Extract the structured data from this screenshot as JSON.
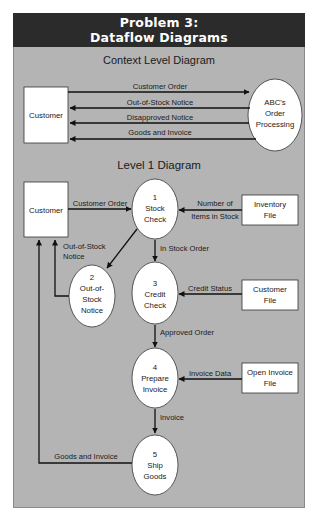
{
  "header": {
    "line1": "Problem 3:",
    "line2": "Dataflow Diagrams"
  },
  "colors": {
    "header_bg": "#2b2b2b",
    "panel_bg": "#b4b4b4",
    "node_fill": "#ffffff",
    "line": "#111111"
  },
  "context": {
    "title": "Context Level Diagram",
    "entity": "Customer",
    "process": {
      "line1": "ABC's",
      "line2": "Order",
      "line3": "Processing"
    },
    "flows": [
      {
        "label": "Customer Order",
        "direction": "to-process"
      },
      {
        "label": "Out-of-Stock Notice",
        "direction": "to-customer"
      },
      {
        "label": "Disapproved Notice",
        "direction": "to-customer"
      },
      {
        "label": "Goods and Invoice",
        "direction": "to-customer"
      }
    ]
  },
  "level1": {
    "title": "Level 1 Diagram",
    "entity": "Customer",
    "processes": [
      {
        "num": "1",
        "line1": "Stock",
        "line2": "Check"
      },
      {
        "num": "2",
        "line1": "Out-of-",
        "line2": "Stock",
        "line3": "Notice"
      },
      {
        "num": "3",
        "line1": "Credit",
        "line2": "Check"
      },
      {
        "num": "4",
        "line1": "Prepare",
        "line2": "Invoice"
      },
      {
        "num": "5",
        "line1": "Ship",
        "line2": "Goods"
      }
    ],
    "stores": [
      {
        "line1": "Inventory",
        "line2": "File"
      },
      {
        "line1": "Customer",
        "line2": "File"
      },
      {
        "line1": "Open Invoice",
        "line2": "File"
      }
    ],
    "flows": {
      "customer_order": "Customer Order",
      "number_items_1": "Number of",
      "number_items_2": "Items in Stock",
      "out_of_stock_1": "Out-of-Stock",
      "out_of_stock_2": "Notice",
      "in_stock_order": "In Stock Order",
      "credit_status": "Credit Status",
      "approved_order": "Approved Order",
      "invoice_data": "Invoice Data",
      "invoice": "Invoice",
      "goods_and_invoice": "Goods and Invoice"
    }
  }
}
